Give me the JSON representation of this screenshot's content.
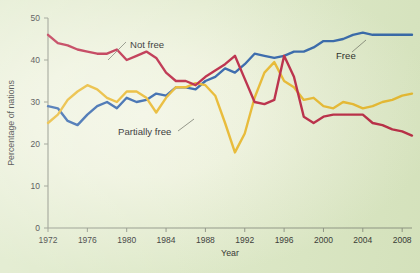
{
  "chart_data": {
    "type": "line",
    "title": "",
    "xlabel": "Year",
    "ylabel": "Percentage of nations",
    "xlim": [
      1972,
      2009
    ],
    "ylim": [
      0,
      50
    ],
    "grid": false,
    "legend_position": "inline-annotations",
    "x_ticks": [
      1972,
      1976,
      1980,
      1984,
      1988,
      1992,
      1996,
      2000,
      2004,
      2008
    ],
    "x_tick_labels": [
      "1972",
      "1976",
      "1980",
      "1984",
      "1988",
      "1992",
      "1996",
      "2000",
      "2004",
      "2008"
    ],
    "y_ticks": [
      0,
      10,
      20,
      30,
      40,
      50
    ],
    "y_tick_labels": [
      "0",
      "10",
      "20",
      "30",
      "40",
      "50"
    ],
    "x": [
      1972,
      1973,
      1974,
      1975,
      1976,
      1977,
      1978,
      1979,
      1980,
      1981,
      1982,
      1983,
      1984,
      1985,
      1986,
      1987,
      1988,
      1989,
      1990,
      1991,
      1992,
      1993,
      1994,
      1995,
      1996,
      1997,
      1998,
      1999,
      2000,
      2001,
      2002,
      2003,
      2004,
      2005,
      2006,
      2007,
      2008,
      2009
    ],
    "series": [
      {
        "name": "Free",
        "color": "#2B5FA8",
        "label": "Free",
        "values": [
          29,
          28.5,
          25.5,
          24.5,
          27,
          29,
          30,
          28.5,
          31,
          30,
          30.5,
          32,
          31.5,
          33.5,
          33.5,
          33,
          35,
          36,
          38,
          37,
          39,
          41.5,
          41,
          40.5,
          41,
          42,
          42,
          43,
          44.5,
          44.5,
          45,
          46,
          46.5,
          46,
          46,
          46,
          46,
          46
        ]
      },
      {
        "name": "Partially free",
        "color": "#E8B629",
        "label": "Partially free",
        "values": [
          25,
          27,
          30.5,
          32.5,
          34,
          33,
          31,
          30,
          32.5,
          32.5,
          31,
          27.5,
          31,
          33.5,
          33.5,
          34.5,
          34,
          31.5,
          25,
          18,
          22.5,
          31,
          37,
          39.5,
          35,
          33.5,
          30.5,
          31,
          29,
          28.5,
          30,
          29.5,
          28.5,
          29,
          30,
          30.5,
          31.5,
          32
        ]
      },
      {
        "name": "Not free",
        "color": "#B8203F",
        "label": "Not free",
        "values": [
          46,
          44,
          43.5,
          42.5,
          42,
          41.5,
          41.5,
          42.5,
          40,
          41,
          42,
          40.5,
          37,
          35,
          35,
          34,
          36,
          37.5,
          39,
          41,
          35.5,
          30,
          29.5,
          30.5,
          41,
          36,
          26.5,
          25,
          26.5,
          27,
          27,
          27,
          27,
          25,
          24.5,
          23.5,
          23,
          22
        ]
      }
    ],
    "annotations": [
      {
        "text": "Not free",
        "x_px": 128,
        "y_px": 45
      },
      {
        "text": "Partially free",
        "x_px": 123,
        "y_px": 133
      },
      {
        "text": "Free",
        "x_px": 349,
        "y_px": 56
      }
    ]
  },
  "axes": {
    "ylabel": "Percentage of nations",
    "xlabel": "Year"
  }
}
